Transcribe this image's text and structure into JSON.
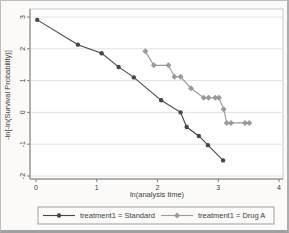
{
  "figure": {
    "background": "#fbfaf8",
    "border_color": "#bdbdbd"
  },
  "chart_data": {
    "type": "line",
    "title": "",
    "xlabel": "ln(analysis time)",
    "ylabel": "-ln[-ln(Survival Probability)]",
    "xlim": [
      0,
      4
    ],
    "ylim": [
      -2,
      3
    ],
    "xticks": [
      0,
      1,
      2,
      3,
      4
    ],
    "yticks": [
      3,
      2,
      1,
      0,
      -1,
      -2
    ],
    "grid": "horizontal",
    "legend_position": "bottom",
    "series": [
      {
        "name": "treatment1 = Standard",
        "marker": "circle",
        "color": "#474747",
        "points": [
          [
            0.02,
            2.91
          ],
          [
            0.69,
            2.13
          ],
          [
            1.08,
            1.86
          ],
          [
            1.36,
            1.43
          ],
          [
            1.61,
            1.1
          ],
          [
            2.06,
            0.38
          ],
          [
            2.38,
            0.0
          ],
          [
            2.48,
            -0.46
          ],
          [
            2.68,
            -0.74
          ],
          [
            2.83,
            -1.03
          ],
          [
            3.08,
            -1.51
          ]
        ]
      },
      {
        "name": "treatment1 = Drug A",
        "marker": "diamond",
        "color": "#9a9a9a",
        "points": [
          [
            1.8,
            1.92
          ],
          [
            1.94,
            1.48
          ],
          [
            2.18,
            1.48
          ],
          [
            2.28,
            1.12
          ],
          [
            2.38,
            1.12
          ],
          [
            2.55,
            0.76
          ],
          [
            2.76,
            0.46
          ],
          [
            2.84,
            0.46
          ],
          [
            2.95,
            0.46
          ],
          [
            3.01,
            0.46
          ],
          [
            3.09,
            0.1
          ],
          [
            3.14,
            -0.33
          ],
          [
            3.21,
            -0.33
          ],
          [
            3.44,
            -0.33
          ],
          [
            3.51,
            -0.33
          ]
        ]
      }
    ],
    "colors": {
      "gridline": "#e2e2e2",
      "axis": "#7f7f7f",
      "frame": "#c9c9c9",
      "plot_bg": "#ffffff",
      "text": "#404040",
      "legend_border": "#9f9f9f"
    }
  }
}
